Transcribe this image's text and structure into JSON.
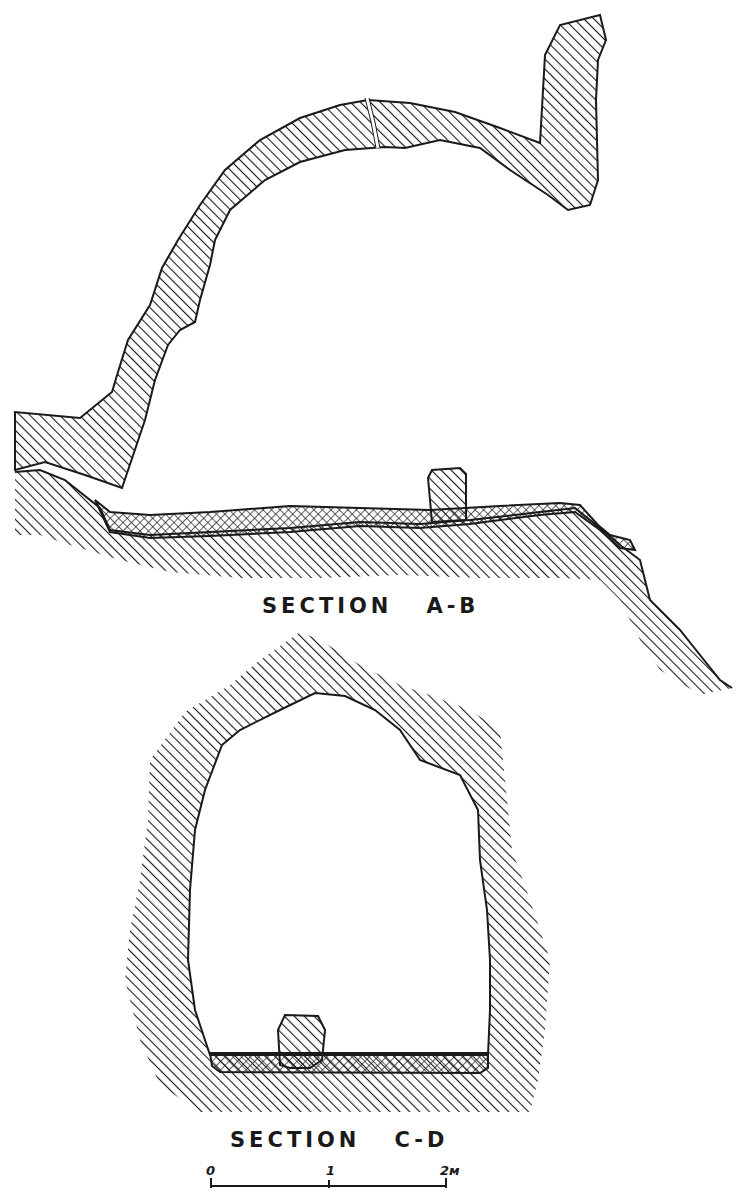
{
  "figure": {
    "section_ab": {
      "label": "SECTION   A-B"
    },
    "section_cd": {
      "label": "SECTION   C-D"
    },
    "scale_bar": {
      "ticks": [
        {
          "label": "0"
        },
        {
          "label": "1"
        },
        {
          "label": "2м"
        }
      ]
    },
    "legend_hint": {
      "rock": "diagonal-hatch",
      "fill_deposit": "cross-hatch"
    },
    "colors": {
      "ink": "#1a1a1a",
      "paper": "#ffffff"
    }
  }
}
